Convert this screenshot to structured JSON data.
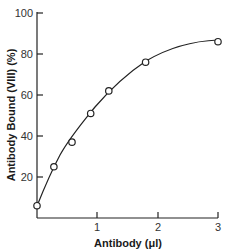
{
  "chart_data": {
    "type": "scatter",
    "title": "",
    "xlabel": "Antibody (μl)",
    "ylabel": "Antibody Bound (VIII) (%)",
    "xlim": [
      0,
      3
    ],
    "ylim": [
      0,
      100
    ],
    "x_ticks": [
      1,
      2,
      3
    ],
    "y_ticks": [
      20,
      40,
      60,
      80,
      100
    ],
    "grid": false,
    "legend": null,
    "series": [
      {
        "name": "Antibody bound",
        "marker": "open-circle",
        "fit_curve": "smooth saturating curve",
        "x": [
          0.0,
          0.28,
          0.58,
          0.89,
          1.19,
          1.8,
          3.0
        ],
        "y": [
          6,
          25,
          37,
          51,
          62,
          76,
          86
        ]
      }
    ]
  },
  "axes": {
    "x_title": "Antibody (μl)",
    "y_title": "Antibody Bound (VIII) (%)",
    "x_tick_labels": [
      "1",
      "2",
      "3"
    ],
    "y_tick_labels": [
      "20",
      "40",
      "60",
      "80",
      "100"
    ]
  }
}
